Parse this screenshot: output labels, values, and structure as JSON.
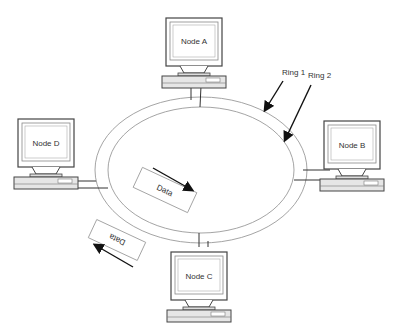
{
  "diagram": {
    "type": "dual-ring network topology",
    "nodes": [
      {
        "id": "A",
        "label": "Node A"
      },
      {
        "id": "B",
        "label": "Node B"
      },
      {
        "id": "C",
        "label": "Node C"
      },
      {
        "id": "D",
        "label": "Node D"
      }
    ],
    "rings": [
      {
        "label": "Ring 1"
      },
      {
        "label": "Ring 2"
      }
    ],
    "packets": [
      {
        "label": "Data",
        "position": "inside ring",
        "direction": "clockwise"
      },
      {
        "label": "Data",
        "position": "outside ring",
        "direction": "counter-clockwise"
      }
    ],
    "colors": {
      "ring": "#9a9a9a",
      "monitor": "#555555",
      "arrow": "#111111"
    }
  }
}
